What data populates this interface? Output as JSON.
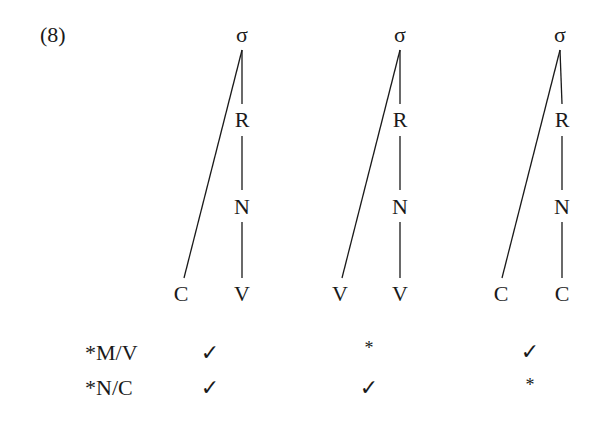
{
  "example_number": "(8)",
  "trees": [
    {
      "root": "σ",
      "rime": "R",
      "nucleus": "N",
      "left_leaf": "C",
      "right_leaf": "V"
    },
    {
      "root": "σ",
      "rime": "R",
      "nucleus": "N",
      "left_leaf": "V",
      "right_leaf": "V"
    },
    {
      "root": "σ",
      "rime": "R",
      "nucleus": "N",
      "left_leaf": "C",
      "right_leaf": "C"
    }
  ],
  "constraints": [
    {
      "label": "*M/V",
      "marks": [
        "✓",
        "*",
        "✓"
      ]
    },
    {
      "label": "*N/C",
      "marks": [
        "✓",
        "✓",
        "*"
      ]
    }
  ]
}
